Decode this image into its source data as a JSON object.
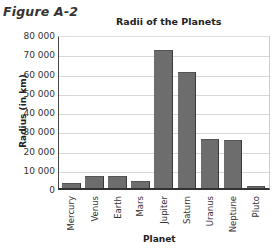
{
  "figure_label": "Figure A-2",
  "chart_data": {
    "type": "bar",
    "title": "Radii of the Planets",
    "xlabel": "Planet",
    "ylabel": "Radius (in km)",
    "ylim": [
      0,
      80000
    ],
    "yticks": [
      "0",
      "10 000",
      "20 000",
      "30 000",
      "40 000",
      "50 000",
      "60 000",
      "70 000",
      "80 000"
    ],
    "grid": true,
    "categories": [
      "Mercury",
      "Venus",
      "Earth",
      "Mars",
      "Jupiter",
      "Saturn",
      "Uranus",
      "Neptune",
      "Pluto"
    ],
    "values": [
      2440,
      6052,
      6378,
      3397,
      71492,
      60268,
      25559,
      24764,
      1160
    ],
    "bar_color": "#6d6d6d"
  }
}
